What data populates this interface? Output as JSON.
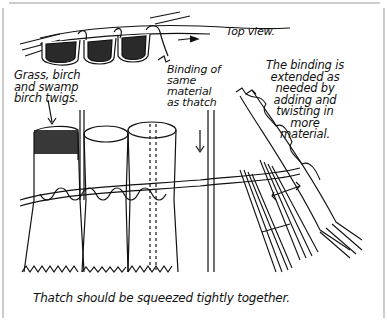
{
  "diagram": {
    "labels": {
      "top_view": "Top view.",
      "grass": "Grass, birch\nand swamp\nbirch twigs.",
      "binding_same": "Binding of\nsame\nmaterial\nas thatch",
      "binding_extended": "The binding is\nextended as\nneeded by\nadding and\ntwisting in\nmore\nmaterial.",
      "caption": "Thatch should be squeezed tightly together."
    },
    "colors": {
      "ink": "#111111",
      "paper": "#ffffff",
      "frame": "#9a9a9a",
      "stipple": "#2a2a2a"
    }
  }
}
